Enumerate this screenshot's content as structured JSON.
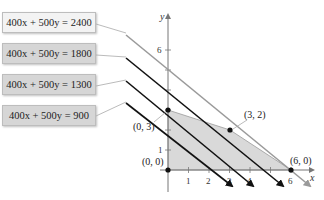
{
  "labels": [
    {
      "text": "400x + 500y = 2400",
      "value": 2400
    },
    {
      "text": "400x + 500y = 1800",
      "value": 1800
    },
    {
      "text": "400x + 500y = 1300",
      "value": 1300
    },
    {
      "text": "400x + 500y = 900",
      "value": 900
    }
  ],
  "axes": {
    "x_label": "x",
    "y_label": "y",
    "x_ticks": [
      "1",
      "2",
      "3",
      "4",
      "6"
    ],
    "y_ticks": [
      "1",
      "6"
    ]
  },
  "points": [
    {
      "label": "(0, 0)",
      "x": 0,
      "y": 0
    },
    {
      "label": "(0, 3)",
      "x": 0,
      "y": 3
    },
    {
      "label": "(3, 2)",
      "x": 3,
      "y": 2
    },
    {
      "label": "(6, 0)",
      "x": 6,
      "y": 0
    }
  ],
  "colors": {
    "region_fill": "#d9d9d9",
    "objective_line": "#111111",
    "max_line": "#9a9a9a"
  }
}
